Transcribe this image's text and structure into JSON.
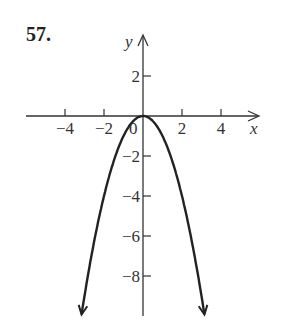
{
  "problem_number": "57.",
  "chart_data": {
    "type": "line",
    "title": "",
    "equation": "y = -x^2",
    "xlabel": "x",
    "ylabel": "y",
    "xlim": [
      -5.5,
      6
    ],
    "ylim": [
      -10,
      4
    ],
    "x_ticks": [
      -4,
      -2,
      2,
      4
    ],
    "x_tick_labels": [
      "−4",
      "−2",
      "2",
      "4"
    ],
    "y_ticks": [
      2,
      -2,
      -4,
      -6,
      -8
    ],
    "y_tick_labels": [
      "2",
      "−2",
      "−4",
      "−6",
      "−8"
    ],
    "origin_label": "0",
    "grid": false,
    "legend": null,
    "series": [
      {
        "name": "y = -x^2",
        "x": [
          -3.1,
          -3,
          -2,
          -1,
          0,
          1,
          2,
          3,
          3.1
        ],
        "y": [
          -9.61,
          -9,
          -4,
          -1,
          0,
          -1,
          -4,
          -9,
          -9.61
        ],
        "arrows_at_ends": true
      }
    ]
  },
  "colors": {
    "ink": "#333333",
    "curve": "#222222",
    "background": "#ffffff"
  }
}
